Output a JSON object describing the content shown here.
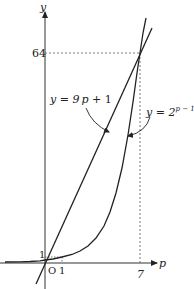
{
  "diagram": {
    "axes": {
      "x_label": "p",
      "y_label": "y",
      "origin_label": "O",
      "x_ticks": [
        {
          "label": "1",
          "value": 1
        },
        {
          "label": "7",
          "value": 7
        }
      ],
      "y_ticks": [
        {
          "label": "1",
          "value": 1
        },
        {
          "label": "64",
          "value": 64
        }
      ]
    },
    "curves": [
      {
        "name": "line",
        "label_lhs": "y = 9",
        "label_var": "p",
        "label_rhs": " + 1",
        "equation": "y = 9p + 1"
      },
      {
        "name": "exponential",
        "label_lhs": "y = 2",
        "label_exp": "p − 1",
        "equation": "y = 2^(p−1)"
      }
    ],
    "intersection": {
      "p": 7,
      "y": 64
    },
    "colors": {
      "stroke": "#222222",
      "guide": "#555555",
      "background": "#ffffff"
    }
  }
}
